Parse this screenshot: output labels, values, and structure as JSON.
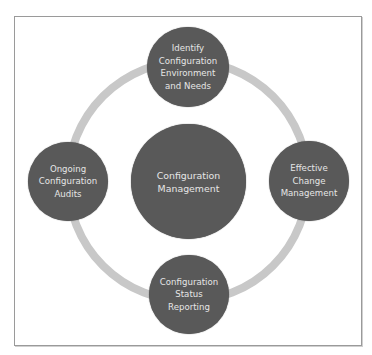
{
  "diagram": {
    "center": {
      "label_lines": [
        "Configuration",
        "Management"
      ]
    },
    "nodes": [
      {
        "id": "top",
        "label_lines": [
          "Identify",
          "Configuration",
          "Environment",
          "and Needs"
        ]
      },
      {
        "id": "right",
        "label_lines": [
          "Effective",
          "Change",
          "Management"
        ]
      },
      {
        "id": "bottom",
        "label_lines": [
          "Configuration",
          "Status",
          "Reporting"
        ]
      },
      {
        "id": "left",
        "label_lines": [
          "Ongoing",
          "Configuration",
          "Audits"
        ]
      }
    ],
    "colors": {
      "node_fill": "#595959",
      "node_text": "#e6e6e6",
      "ring": "#c8c8c8",
      "frame_border": "#9a9a9a"
    }
  }
}
